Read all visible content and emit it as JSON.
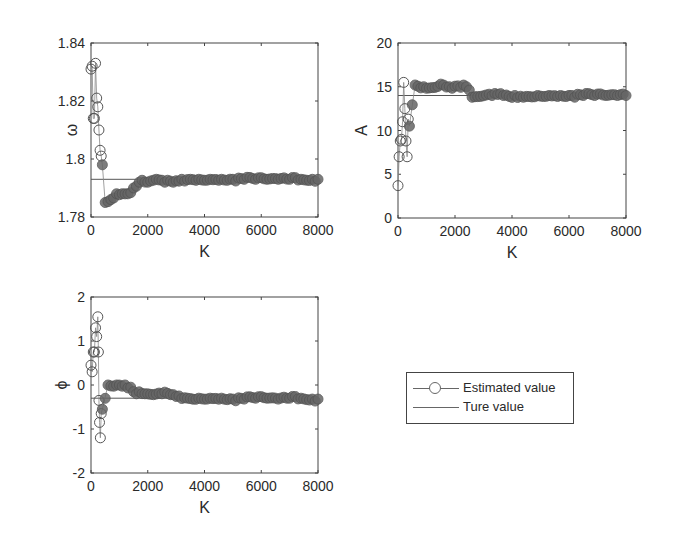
{
  "chart_data": [
    {
      "type": "scatter",
      "title": "",
      "xlabel": "K",
      "ylabel": "ω",
      "xlim": [
        0,
        8000
      ],
      "ylim": [
        1.78,
        1.84
      ],
      "xticks": [
        "0",
        "2000",
        "4000",
        "6000",
        "8000"
      ],
      "yticks": [
        "1.78",
        "1.8",
        "1.82",
        "1.84"
      ],
      "ytick_values": [
        1.78,
        1.8,
        1.82,
        1.84
      ],
      "true_value": 1.793,
      "series": [
        {
          "name": "Estimated value",
          "x": [
            0,
            40,
            80,
            120,
            160,
            200,
            240,
            280,
            320,
            360,
            400,
            500,
            700,
            900,
            1100,
            1300,
            1500,
            1700,
            2000,
            2300,
            2600,
            2900,
            3200,
            3500,
            3800,
            4200,
            4600,
            5000,
            5400,
            5800,
            6200,
            6600,
            7000,
            7400,
            7800,
            8000
          ],
          "y": [
            1.831,
            1.832,
            1.814,
            1.814,
            1.833,
            1.821,
            1.818,
            1.81,
            1.803,
            1.801,
            1.798,
            1.785,
            1.786,
            1.788,
            1.788,
            1.788,
            1.79,
            1.792,
            1.792,
            1.793,
            1.792,
            1.792,
            1.793,
            1.793,
            1.793,
            1.793,
            1.793,
            1.793,
            1.793,
            1.793,
            1.793,
            1.793,
            1.793,
            1.793,
            1.793,
            1.793
          ]
        },
        {
          "name": "Ture value",
          "y_const": 1.793
        }
      ]
    },
    {
      "type": "scatter",
      "title": "",
      "xlabel": "K",
      "ylabel": "A",
      "xlim": [
        0,
        8000
      ],
      "ylim": [
        0,
        20
      ],
      "xticks": [
        "0",
        "2000",
        "4000",
        "6000",
        "8000"
      ],
      "yticks": [
        "0",
        "5",
        "10",
        "15",
        "20"
      ],
      "ytick_values": [
        0,
        5,
        10,
        15,
        20
      ],
      "true_value": 14,
      "series": [
        {
          "name": "Estimated value",
          "x": [
            0,
            40,
            80,
            120,
            160,
            200,
            240,
            280,
            320,
            360,
            400,
            600,
            900,
            1200,
            1500,
            1800,
            2100,
            2400,
            2600,
            2900,
            3300,
            3700,
            4100,
            4500,
            4900,
            5300,
            5700,
            6100,
            6500,
            6900,
            7300,
            7700,
            8000
          ],
          "y": [
            3.7,
            7.0,
            8.8,
            9.0,
            11.0,
            15.5,
            12.5,
            8.8,
            7.0,
            11.3,
            10.5,
            15.2,
            15.0,
            14.9,
            15.3,
            15.0,
            15.1,
            15.0,
            13.8,
            13.9,
            14.0,
            14.0,
            14.0,
            13.9,
            14.0,
            14.0,
            14.0,
            14.0,
            14.0,
            14.0,
            14.0,
            14.0,
            14.0
          ]
        },
        {
          "name": "Ture value",
          "y_const": 14
        }
      ]
    },
    {
      "type": "scatter",
      "title": "",
      "xlabel": "K",
      "ylabel": "ϕ",
      "xlim": [
        0,
        8000
      ],
      "ylim": [
        -2,
        2
      ],
      "xticks": [
        "0",
        "2000",
        "4000",
        "6000",
        "8000"
      ],
      "yticks": [
        "-2",
        "-1",
        "0",
        "1",
        "2"
      ],
      "ytick_values": [
        -2,
        -1,
        0,
        1,
        2
      ],
      "true_value": -0.3,
      "series": [
        {
          "name": "Estimated value",
          "x": [
            0,
            40,
            80,
            120,
            160,
            200,
            240,
            260,
            280,
            300,
            330,
            360,
            400,
            600,
            900,
            1200,
            1400,
            1600,
            1900,
            2200,
            2500,
            2800,
            3100,
            3400,
            3800,
            4200,
            4600,
            5000,
            5400,
            5800,
            6200,
            6600,
            7000,
            7400,
            7800,
            8000
          ],
          "y": [
            0.45,
            0.3,
            0.75,
            0.75,
            1.3,
            1.1,
            1.55,
            0.75,
            -0.35,
            -0.85,
            -1.2,
            -0.65,
            -0.55,
            0.0,
            0.0,
            0.0,
            -0.05,
            -0.2,
            -0.2,
            -0.22,
            -0.2,
            -0.22,
            -0.25,
            -0.3,
            -0.3,
            -0.3,
            -0.3,
            -0.32,
            -0.32,
            -0.3,
            -0.3,
            -0.32,
            -0.3,
            -0.3,
            -0.32,
            -0.32
          ]
        },
        {
          "name": "Ture value",
          "y_const": -0.3
        }
      ]
    }
  ],
  "legend": {
    "entries": [
      {
        "label": "Estimated value",
        "marker": "circle-line"
      },
      {
        "label": "Ture value",
        "marker": "line"
      }
    ]
  },
  "colors": {
    "marker": "#555555",
    "marker_dense": "#666666",
    "true_line": "#555555",
    "axis": "#444444"
  }
}
